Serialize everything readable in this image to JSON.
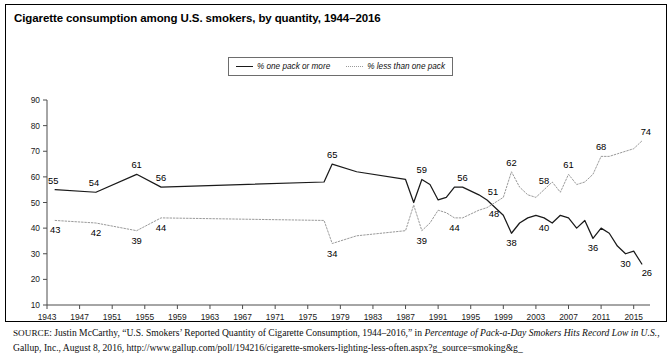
{
  "title": "Cigarette consumption among U.S. smokers, by quantity, 1944–2016",
  "legend": {
    "series_one_label": "% one pack or more",
    "series_two_label": "% less than one pack",
    "position": "top-center"
  },
  "source": {
    "prefix": "SOURCE",
    "text_part1": ": Justin McCarthy, “U.S. Smokers’ Reported Quantity of Cigarette Consumption, 1944–2016,” in ",
    "italic_part": "Percentage of Pack-a-Day Smokers Hits Record Low in U.S.",
    "text_part2": ", Gallup, Inc., August 8, 2016, http://www.gallup.com/poll/194216/cigarette-smokers-lighting-less-often.aspx?g_source=smoking&g_"
  },
  "colors": {
    "series_one": "#1a1a1a",
    "series_two": "#9a9a9a",
    "axis": "#4d4d4d",
    "frame": "#000000",
    "background": "#ffffff"
  },
  "chart_data": {
    "type": "line",
    "title": "Cigarette consumption among U.S. smokers, by quantity, 1944–2016",
    "xlabel": "",
    "ylabel": "",
    "xlim": [
      1943,
      2017
    ],
    "ylim": [
      10,
      90
    ],
    "ytick_labels": [
      "10",
      "20",
      "30",
      "40",
      "50",
      "60",
      "70",
      "80",
      "90"
    ],
    "yticks": [
      10,
      20,
      30,
      40,
      50,
      60,
      70,
      80,
      90
    ],
    "xtick_labels": [
      "1943",
      "1947",
      "1951",
      "1955",
      "1959",
      "1963",
      "1967",
      "1971",
      "1975",
      "1979",
      "1983",
      "1987",
      "1991",
      "1995",
      "1999",
      "2003",
      "2007",
      "2011",
      "2015"
    ],
    "xticks": [
      1943,
      1947,
      1951,
      1955,
      1959,
      1963,
      1967,
      1971,
      1975,
      1979,
      1983,
      1987,
      1991,
      1995,
      1999,
      2003,
      2007,
      2011,
      2015
    ],
    "grid": false,
    "legend_position": "top-center",
    "series": [
      {
        "name": "% one pack or more",
        "style": "solid",
        "color": "#1a1a1a",
        "x": [
          1944,
          1949,
          1954,
          1957,
          1977,
          1978,
          1981,
          1987,
          1988,
          1989,
          1990,
          1991,
          1992,
          1993,
          1994,
          1996,
          1997,
          1999,
          2000,
          2001,
          2002,
          2003,
          2004,
          2005,
          2006,
          2007,
          2008,
          2009,
          2010,
          2011,
          2012,
          2013,
          2014,
          2015,
          2016
        ],
        "y": [
          55,
          54,
          61,
          56,
          58,
          65,
          62,
          59,
          50,
          59,
          57,
          51,
          52,
          56,
          56,
          53,
          51,
          45,
          38,
          42,
          44,
          45,
          44,
          42,
          45,
          44,
          40,
          43,
          36,
          40,
          38,
          33,
          30,
          31,
          26
        ],
        "labeled_points": [
          {
            "x": 1944,
            "y": 55,
            "label": "55"
          },
          {
            "x": 1949,
            "y": 54,
            "label": "54"
          },
          {
            "x": 1954,
            "y": 61,
            "label": "61"
          },
          {
            "x": 1957,
            "y": 56,
            "label": "56"
          },
          {
            "x": 1978,
            "y": 65,
            "label": "65"
          },
          {
            "x": 1989,
            "y": 59,
            "label": "59"
          },
          {
            "x": 1994,
            "y": 56,
            "label": "56"
          },
          {
            "x": 1997,
            "y": 51,
            "label": "51"
          },
          {
            "x": 2000,
            "y": 38,
            "label": "38"
          },
          {
            "x": 2004,
            "y": 44,
            "label": "40"
          },
          {
            "x": 2010,
            "y": 36,
            "label": "36"
          },
          {
            "x": 2014,
            "y": 30,
            "label": "30"
          },
          {
            "x": 2016,
            "y": 26,
            "label": "26"
          }
        ]
      },
      {
        "name": "% less than one pack",
        "style": "dotted",
        "color": "#9a9a9a",
        "x": [
          1944,
          1949,
          1954,
          1957,
          1977,
          1978,
          1981,
          1987,
          1988,
          1989,
          1990,
          1991,
          1992,
          1993,
          1994,
          1996,
          1997,
          1999,
          2000,
          2001,
          2002,
          2003,
          2004,
          2005,
          2006,
          2007,
          2008,
          2009,
          2010,
          2011,
          2012,
          2013,
          2014,
          2015,
          2016
        ],
        "y": [
          43,
          42,
          39,
          44,
          43,
          34,
          37,
          39,
          49,
          39,
          42,
          47,
          46,
          44,
          44,
          47,
          48,
          52,
          62,
          56,
          53,
          52,
          55,
          58,
          54,
          61,
          57,
          58,
          61,
          68,
          68,
          69,
          70,
          71,
          74
        ],
        "labeled_points": [
          {
            "x": 1944,
            "y": 43,
            "label": "43"
          },
          {
            "x": 1949,
            "y": 42,
            "label": "42"
          },
          {
            "x": 1954,
            "y": 39,
            "label": "39"
          },
          {
            "x": 1957,
            "y": 44,
            "label": "44"
          },
          {
            "x": 1978,
            "y": 34,
            "label": "34"
          },
          {
            "x": 1989,
            "y": 39,
            "label": "39"
          },
          {
            "x": 1993,
            "y": 44,
            "label": "44"
          },
          {
            "x": 1997,
            "y": 48,
            "label": "48"
          },
          {
            "x": 2000,
            "y": 62,
            "label": "62"
          },
          {
            "x": 2004,
            "y": 55,
            "label": "58"
          },
          {
            "x": 2007,
            "y": 61,
            "label": "61"
          },
          {
            "x": 2011,
            "y": 68,
            "label": "68"
          },
          {
            "x": 2016,
            "y": 74,
            "label": "74"
          }
        ]
      }
    ]
  }
}
